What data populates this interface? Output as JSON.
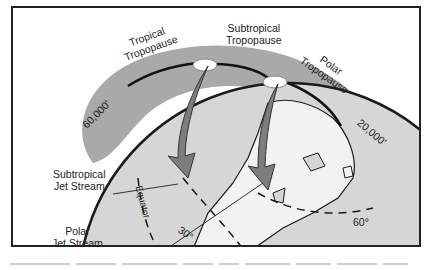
{
  "diagram": {
    "labels": {
      "tropical_tropopause": [
        "Tropical",
        "Tropopause"
      ],
      "subtropical_tropopause": [
        "Subtropical",
        "Tropopause"
      ],
      "polar_tropopause": [
        "Polar",
        "Tropopause"
      ],
      "altitude_high": "60,000'",
      "altitude_low": "20,000'",
      "subtropical_jet": [
        "Subtropical",
        "Jet Stream"
      ],
      "polar_jet": [
        "Polar",
        "Jet Stream"
      ],
      "equator": "Equator",
      "lat_30": "30°",
      "lat_60": "60°"
    },
    "colors": {
      "atmosphere": "#a9a9a9",
      "globe": "#d6d6d6",
      "land": "#f2f2f2",
      "outline": "#1a1a1a",
      "arrow": "#7d7d7d"
    }
  }
}
